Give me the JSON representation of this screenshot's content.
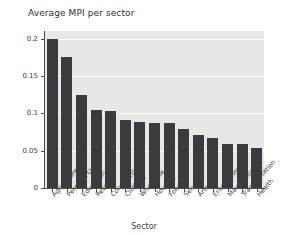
{
  "chart_data": {
    "type": "bar",
    "title": "Average MPI per sector",
    "xlabel": "Sector",
    "ylabel": "Average MPI",
    "categories": [
      "Agriculture",
      "Personal Use",
      "Education",
      "Retail",
      "Construction",
      "Clothing",
      "Wholesale",
      "Housing",
      "Food",
      "Services",
      "Arts",
      "Entertainment",
      "Manufacturing",
      "Transportation",
      "Health"
    ],
    "values": [
      0.199,
      0.175,
      0.124,
      0.104,
      0.103,
      0.091,
      0.0885,
      0.0875,
      0.0865,
      0.0785,
      0.0715,
      0.067,
      0.059,
      0.059,
      0.054
    ],
    "ylim": [
      0,
      0.21
    ],
    "yticks": [
      0,
      0.05,
      0.1,
      0.15,
      0.2
    ],
    "ytick_labels": [
      "0",
      "0.05",
      "0.1",
      "0.15",
      "0.2"
    ],
    "grid": true,
    "grid_axis": "y",
    "legend": "none",
    "bar_color": "#3b3b3d",
    "plot_background": "#e7e7e7",
    "figure_background": "#ffffff",
    "gridline_color": "#fdfdfd"
  }
}
